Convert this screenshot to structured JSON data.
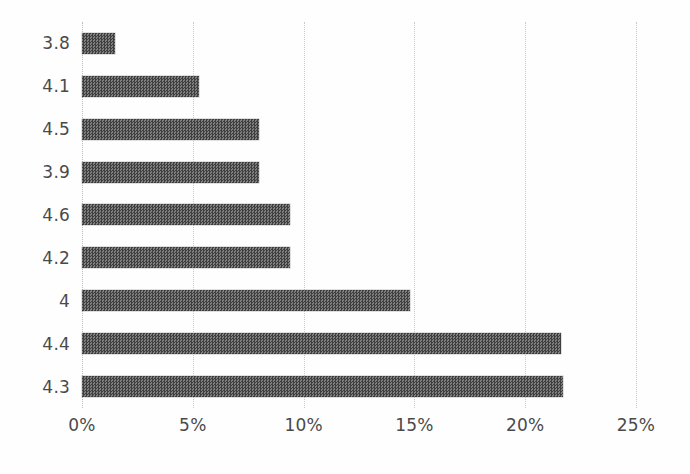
{
  "chart_data": {
    "type": "bar",
    "orientation": "horizontal",
    "title": "",
    "subtitle": "",
    "xlabel": "",
    "ylabel": "",
    "categories": [
      "3.8",
      "4.1",
      "4.5",
      "3.9",
      "4.6",
      "4.2",
      "4",
      "4.4",
      "4.3"
    ],
    "values": [
      1.5,
      5.3,
      8.0,
      8.0,
      9.4,
      9.4,
      14.8,
      21.6,
      21.7
    ],
    "value_format": "percent",
    "xlim": [
      0,
      25
    ],
    "xticks": [
      0,
      5,
      10,
      15,
      20,
      25
    ],
    "xtick_labels": [
      "0%",
      "5%",
      "10%",
      "15%",
      "20%",
      "25%"
    ],
    "grid": "vertical-dotted",
    "legend": "none",
    "series": [
      {
        "name": "",
        "values": [
          1.5,
          5.3,
          8.0,
          8.0,
          9.4,
          9.4,
          14.8,
          21.6,
          21.7
        ]
      }
    ],
    "colors": {
      "bar": "#5b5b5b",
      "bar_dark": "#3f3f3f",
      "bar_light": "#7e7e7e",
      "gridline": "#c9c9c9",
      "text": "#4a4a4a",
      "background": "#ffffff"
    }
  }
}
